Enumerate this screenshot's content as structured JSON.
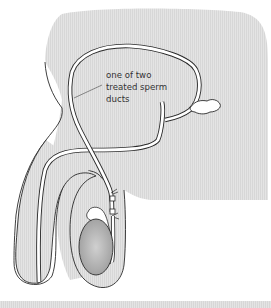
{
  "diagram": {
    "label": {
      "lines": [
        "one of two",
        "treated sperm",
        "ducts"
      ]
    },
    "colors": {
      "body_fill": "#e3e3e3",
      "body_fill_stripe": "#d6d6d6",
      "outline": "#2a2a2a",
      "duct_fill": "#ffffff",
      "testis_fill": "#a8a8a8",
      "testis_highlight": "#cfcfcf",
      "background": "#ffffff"
    },
    "parts": [
      {
        "name": "body-outline"
      },
      {
        "name": "sperm-duct"
      },
      {
        "name": "seminal-vesicle"
      },
      {
        "name": "cut-tied-ends"
      },
      {
        "name": "testis"
      },
      {
        "name": "epididymis"
      },
      {
        "name": "penis"
      },
      {
        "name": "urethra"
      },
      {
        "name": "scrotum"
      },
      {
        "name": "bladder-loop"
      }
    ]
  }
}
